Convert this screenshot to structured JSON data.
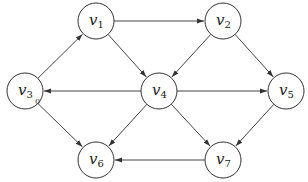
{
  "diagram": {
    "type": "directed-graph",
    "node_radius": 18,
    "colors": {
      "stroke": "#333333",
      "fill": "#ffffff",
      "text": "#222222"
    },
    "nodes": [
      {
        "id": "v1",
        "base": "v",
        "sub": "1",
        "x": 96,
        "y": 21
      },
      {
        "id": "v2",
        "base": "v",
        "sub": "2",
        "x": 223,
        "y": 21
      },
      {
        "id": "v3",
        "base": "v",
        "sub": "3",
        "x": 25,
        "y": 91
      },
      {
        "id": "v4",
        "base": "v",
        "sub": "4",
        "x": 159,
        "y": 91
      },
      {
        "id": "v5",
        "base": "v",
        "sub": "5",
        "x": 286,
        "y": 91
      },
      {
        "id": "v6",
        "base": "v",
        "sub": "6",
        "x": 96,
        "y": 160
      },
      {
        "id": "v7",
        "base": "v",
        "sub": "7",
        "x": 223,
        "y": 160
      }
    ],
    "edges": [
      {
        "from": "v1",
        "to": "v2"
      },
      {
        "from": "v3",
        "to": "v1"
      },
      {
        "from": "v1",
        "to": "v4"
      },
      {
        "from": "v2",
        "to": "v4"
      },
      {
        "from": "v2",
        "to": "v5"
      },
      {
        "from": "v4",
        "to": "v3"
      },
      {
        "from": "v4",
        "to": "v5"
      },
      {
        "from": "v3",
        "to": "v6"
      },
      {
        "from": "v4",
        "to": "v6"
      },
      {
        "from": "v4",
        "to": "v7"
      },
      {
        "from": "v5",
        "to": "v7"
      },
      {
        "from": "v7",
        "to": "v6"
      }
    ],
    "annotations": [
      {
        "text": "0",
        "x": 35,
        "y": 104,
        "near": "v3"
      }
    ]
  }
}
